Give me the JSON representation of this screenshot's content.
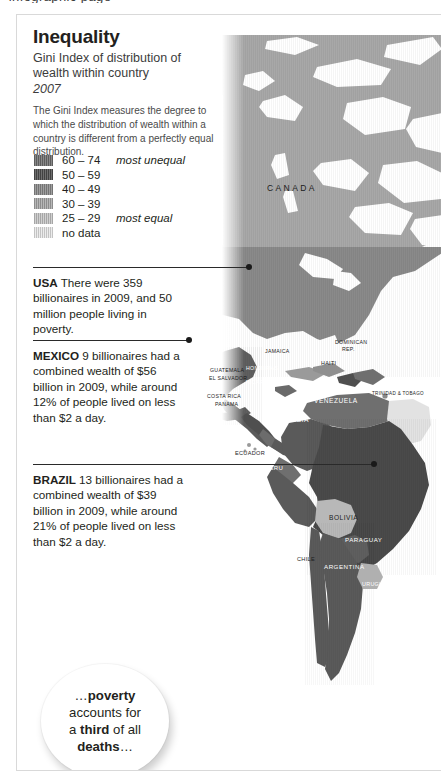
{
  "page": {
    "cut_text_top": "· infographic page ·"
  },
  "header": {
    "title": "Inequality",
    "subtitle": "Gini Index of distribution of wealth within country",
    "year": "2007",
    "description": "The Gini Index measures the degree to which the distribution of wealth within a country is different from a perfectly equal distribution."
  },
  "legend": {
    "rows": [
      {
        "range": "60 – 74",
        "note": "most unequal",
        "color": "#6f6f6f"
      },
      {
        "range": "50 – 59",
        "note": "",
        "color": "#4f4f4f"
      },
      {
        "range": "40 – 49",
        "note": "",
        "color": "#8a8a8a"
      },
      {
        "range": "30 – 39",
        "note": "",
        "color": "#a8a8a8"
      },
      {
        "range": "25 – 29",
        "note": "most equal",
        "color": "#c6c6c6"
      },
      {
        "range": "no data",
        "note": "",
        "color": "#e6e6e6"
      }
    ]
  },
  "callouts": [
    {
      "country": "USA",
      "text": " There were 359 billionaires in 2009, and 50 million people living in poverty."
    },
    {
      "country": "MEXICO",
      "text": " 9 billionaires had a combined wealth of $56 billion in 2009, while around 12% of people lived on less than $2 a day."
    },
    {
      "country": "BRAZIL",
      "text": " 13 billionaires had a combined wealth of $39 billion in 2009, while around 21% of people lived on less than $2 a day."
    }
  ],
  "bubble": {
    "line1_a": "…",
    "line1_b": "poverty",
    "line2": "accounts for",
    "line3_a": "a ",
    "line3_b": "third",
    "line3_c": " of all",
    "line4_b": "deaths",
    "line4_c": "…"
  },
  "map": {
    "labels": [
      {
        "name": "CANADA"
      },
      {
        "name": "JAMAICA"
      },
      {
        "name": "DOMINICAN"
      },
      {
        "name": "REP."
      },
      {
        "name": "HAITI"
      },
      {
        "name": "GUATEMALA"
      },
      {
        "name": "EL SALVADOR"
      },
      {
        "name": "HONDURAS"
      },
      {
        "name": "NICARAGUA"
      },
      {
        "name": "COSTA RICA"
      },
      {
        "name": "PANAMA"
      },
      {
        "name": "VENEZUELA"
      },
      {
        "name": "TRINIDAD & TOBAGO"
      },
      {
        "name": "COLOMBIA"
      },
      {
        "name": "ECUADOR"
      },
      {
        "name": "PERU"
      },
      {
        "name": "BOLIVIA"
      },
      {
        "name": "PARAGUAY"
      },
      {
        "name": "CHILE"
      },
      {
        "name": "ARGENTINA"
      },
      {
        "name": "URUGUAY"
      }
    ],
    "colors": {
      "ocean": "#ffffff",
      "darkest": "#4f4f4f",
      "dark": "#6f6f6f",
      "mid": "#8a8a8a",
      "light": "#a8a8a8",
      "lighter": "#c6c6c6",
      "nodata": "#e6e6e6"
    }
  }
}
